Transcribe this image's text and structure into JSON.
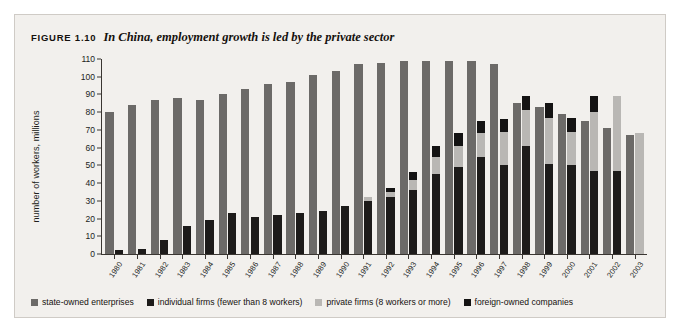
{
  "figure": {
    "number_label": "FIGURE 1.10",
    "caption": "In China, employment growth is led by the private sector"
  },
  "legend": {
    "items": [
      {
        "label": "state-owned enterprises",
        "color": "#6c6a68",
        "key": "state"
      },
      {
        "label": "individual firms (fewer than 8 workers)",
        "color": "#1d1b1a",
        "key": "individual"
      },
      {
        "label": "private firms (8 workers or more)",
        "color": "#b9b7b4",
        "key": "private"
      },
      {
        "label": "foreign-owned companies",
        "color": "#141313",
        "key": "foreign"
      }
    ]
  },
  "chart_data": {
    "type": "bar",
    "title": "In China, employment growth is led by the private sector",
    "xlabel": "",
    "ylabel": "number of workers, millions",
    "ylim": [
      0,
      110
    ],
    "yticks": [
      0,
      10,
      20,
      30,
      40,
      50,
      60,
      70,
      80,
      90,
      100,
      110
    ],
    "grid": false,
    "legend_position": "bottom",
    "layout": "paired: state-owned bar beside a stacked bar of individual + private + foreign",
    "categories": [
      "1980",
      "1981",
      "1982",
      "1983",
      "1984",
      "1985",
      "1986",
      "1987",
      "1988",
      "1989",
      "1990",
      "1991",
      "1992",
      "1993",
      "1994",
      "1995",
      "1996",
      "1997",
      "1998",
      "1999",
      "2000",
      "2001",
      "2002",
      "2003"
    ],
    "series": [
      {
        "name": "state-owned enterprises",
        "color": "#6c6a68",
        "values": [
          80,
          84,
          87,
          88,
          87,
          90,
          93,
          96,
          97,
          101,
          103,
          107,
          108,
          109,
          109,
          109,
          109,
          107,
          85,
          83,
          79,
          75,
          71,
          67
        ]
      },
      {
        "name": "individual firms (fewer than 8 workers)",
        "color": "#1d1b1a",
        "values": [
          2,
          3,
          8,
          16,
          19,
          23,
          21,
          22,
          23,
          24,
          27,
          30,
          32,
          36,
          45,
          49,
          55,
          50,
          61,
          51,
          50,
          47,
          47,
          0
        ]
      },
      {
        "name": "private firms (8 workers or more)",
        "color": "#b9b7b4",
        "values": [
          0,
          0,
          0,
          0,
          0,
          0,
          0,
          0,
          0,
          0,
          0,
          2,
          3,
          6,
          10,
          12,
          13,
          19,
          20,
          26,
          19,
          33,
          42,
          68
        ]
      },
      {
        "name": "foreign-owned companies",
        "color": "#141313",
        "values": [
          0,
          0,
          0,
          0,
          0,
          0,
          0,
          0,
          0,
          0,
          0,
          0,
          2,
          4,
          6,
          7,
          7,
          7,
          8,
          8,
          8,
          9,
          0,
          0
        ]
      }
    ]
  }
}
